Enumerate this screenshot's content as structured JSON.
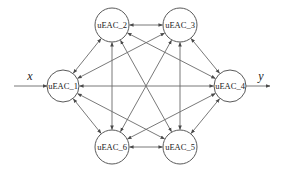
{
  "diagram": {
    "type": "directed-graph",
    "input_label": "x",
    "output_label": "y",
    "colors": {
      "stroke": "#6a6a6a",
      "node_border": "#5a5a5a",
      "text": "#222222",
      "background": "#ffffff"
    },
    "nodes": [
      {
        "id": "n1",
        "label": "uEAC_1",
        "cx": 63,
        "cy": 86,
        "r": 16
      },
      {
        "id": "n2",
        "label": "uEAC_2",
        "cx": 112,
        "cy": 25,
        "r": 17
      },
      {
        "id": "n3",
        "label": "uEAC_3",
        "cx": 180,
        "cy": 25,
        "r": 17
      },
      {
        "id": "n4",
        "label": "uEAC_4",
        "cx": 230,
        "cy": 86,
        "r": 16
      },
      {
        "id": "n5",
        "label": "uEAC_5",
        "cx": 180,
        "cy": 147,
        "r": 17
      },
      {
        "id": "n6",
        "label": "uEAC_6",
        "cx": 112,
        "cy": 147,
        "r": 17
      }
    ],
    "edges": [
      {
        "from": "n1",
        "to": "n2",
        "bidirectional": true
      },
      {
        "from": "n2",
        "to": "n3",
        "bidirectional": true
      },
      {
        "from": "n3",
        "to": "n4",
        "bidirectional": true
      },
      {
        "from": "n1",
        "to": "n6",
        "bidirectional": true
      },
      {
        "from": "n6",
        "to": "n5",
        "bidirectional": true
      },
      {
        "from": "n5",
        "to": "n4",
        "bidirectional": true
      },
      {
        "from": "n1",
        "to": "n4",
        "bidirectional": true
      },
      {
        "from": "n2",
        "to": "n6",
        "bidirectional": true
      },
      {
        "from": "n3",
        "to": "n5",
        "bidirectional": true
      },
      {
        "from": "n2",
        "to": "n5",
        "bidirectional": true
      },
      {
        "from": "n3",
        "to": "n6",
        "bidirectional": true
      },
      {
        "from": "n1",
        "to": "n3",
        "bidirectional": true
      },
      {
        "from": "n1",
        "to": "n5",
        "bidirectional": true
      },
      {
        "from": "n2",
        "to": "n4",
        "bidirectional": true
      },
      {
        "from": "n6",
        "to": "n4",
        "bidirectional": true
      }
    ],
    "io": {
      "input": {
        "x1": 14,
        "y1": 86,
        "x2": 47,
        "y2": 86,
        "label_x": 30,
        "label_y": 80
      },
      "output": {
        "x1": 246,
        "y1": 86,
        "x2": 270,
        "y2": 86,
        "label_x": 261,
        "label_y": 80
      }
    }
  }
}
